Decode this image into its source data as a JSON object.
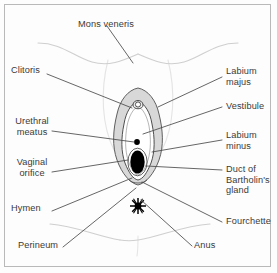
{
  "figure": {
    "border_color": "#b9b9b9",
    "background_color": "#fdfdfd",
    "text_color": "#3a3a3a",
    "leader_line_color": "#4a4a4a",
    "contour_color": "#cfcfcf",
    "labia_majora_fill": "#d8d8d8",
    "vestibule_fill": "#ffffff",
    "orifice_fill": "#000000"
  },
  "labels": {
    "mons_veneris": "Mons veneris",
    "clitoris": "Clitoris",
    "urethral_meatus": "Urethral\nmeatus",
    "vaginal_orifice": "Vaginal\norifice",
    "hymen": "Hymen",
    "perineum": "Perineum",
    "labium_majus": "Labium\nmajus",
    "vestibule": "Vestibule",
    "labium_minus": "Labium\nminus",
    "duct_of_bartholins_gland": "Duct of\nBartholin's\ngland",
    "fourchette": "Fourchette",
    "anus": "Anus"
  },
  "structures": [
    {
      "name": "mons-veneris",
      "side": "top"
    },
    {
      "name": "clitoris",
      "side": "left"
    },
    {
      "name": "urethral-meatus",
      "side": "left"
    },
    {
      "name": "vaginal-orifice",
      "side": "left"
    },
    {
      "name": "hymen",
      "side": "left"
    },
    {
      "name": "perineum",
      "side": "left"
    },
    {
      "name": "labium-majus",
      "side": "right"
    },
    {
      "name": "vestibule",
      "side": "right"
    },
    {
      "name": "labium-minus",
      "side": "right"
    },
    {
      "name": "duct-of-bartholins-gland",
      "side": "right"
    },
    {
      "name": "fourchette",
      "side": "right"
    },
    {
      "name": "anus",
      "side": "bottom"
    }
  ]
}
